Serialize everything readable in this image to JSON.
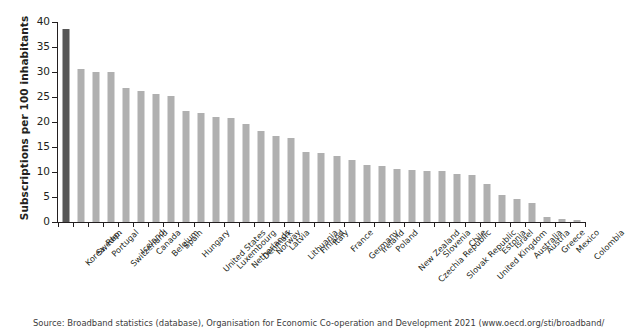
{
  "chart_data": {
    "type": "bar",
    "title": "",
    "xlabel": "",
    "ylabel": "Subscriptions per 100 inhabitants",
    "ylim": [
      0,
      40
    ],
    "yticks": [
      0,
      5,
      10,
      15,
      20,
      25,
      30,
      35,
      40
    ],
    "grid": false,
    "legend": null,
    "highlight_category": "Korea, Rep.",
    "highlight_color": "#575757",
    "bar_color": "#b0b0b0",
    "categories": [
      "Korea, Rep.",
      "Sweden",
      "Portugal",
      "Switzerland",
      "Iceland",
      "Canada",
      "Belgium",
      "Spain",
      "Hungary",
      "United States",
      "Luxembourg",
      "Netherlands",
      "Denmark",
      "Norway",
      "Latvia",
      "Lithuania",
      "Finland",
      "Italy",
      "France",
      "Germany",
      "Ireland",
      "Poland",
      "New Zealand",
      "Czechia Republic",
      "Slovenia",
      "Slovak Republic",
      "Chile",
      "United Kingdom",
      "Estonia",
      "Israel",
      "Australia",
      "Austria",
      "Greece",
      "Mexico",
      "Colombia"
    ],
    "values": [
      38.7,
      30.7,
      30.1,
      30.0,
      26.8,
      26.2,
      25.6,
      25.3,
      22.2,
      21.9,
      21.1,
      20.8,
      19.6,
      18.2,
      17.3,
      16.8,
      14.1,
      13.9,
      13.3,
      12.5,
      11.5,
      11.2,
      10.6,
      10.4,
      10.3,
      10.2,
      9.6,
      9.5,
      7.7,
      5.4,
      4.6,
      3.9,
      1.0,
      0.6,
      0.4
    ]
  },
  "source": {
    "text": "Source: Broadband statistics (database), Organisation for Economic Co-operation and Development 2021 (www.oecd.org/sti/broadband/"
  }
}
